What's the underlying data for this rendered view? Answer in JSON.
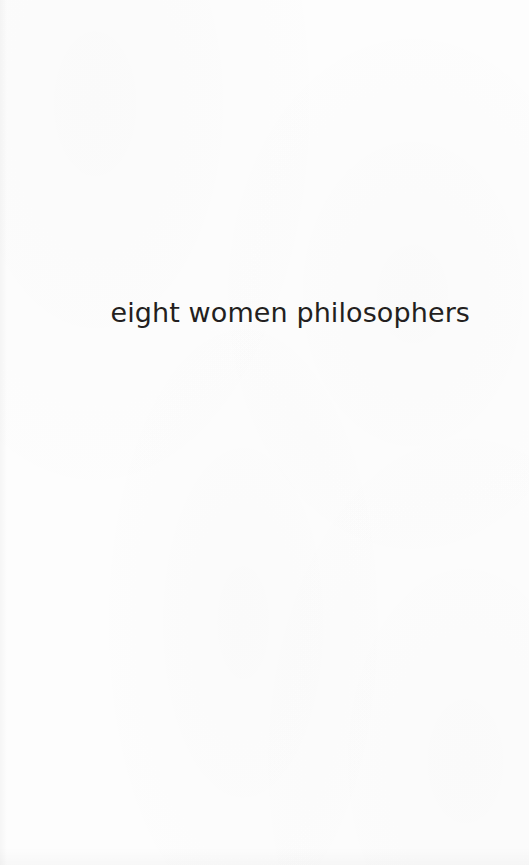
{
  "document": {
    "kind": "book-half-title-page",
    "page_background_color": "#fdfdfd",
    "text_color": "#231f20"
  },
  "halftitle": {
    "text": "eight women philosophers",
    "alignment": "right",
    "case": "lowercase",
    "typeface_style": "geometric-sans-serif"
  },
  "page_marks": {
    "header": "",
    "footer": "",
    "page_number": ""
  }
}
